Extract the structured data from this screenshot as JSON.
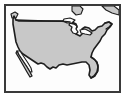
{
  "image": {
    "kind": "map-thumbnail",
    "title": "Map of the contiguous United States",
    "alt_text": "Small gray outline map of the contiguous United States on a white background inside a thin dark rectangular frame",
    "width_px": 128,
    "height_px": 103
  },
  "frame": {
    "name": "map-border",
    "border_color": "#3a3a3a",
    "border_width_px": 2,
    "inset_px": 4,
    "outer_background": "#ffffff"
  },
  "map": {
    "region_label": "Contiguous United States",
    "projection_hint": "conic",
    "background_color": "#fdfdfd",
    "land_fill_color": "#c8c8c8",
    "land_outline_color": "#1e1e1e",
    "land_outline_width_px": 1.6,
    "water_color": "#ffffff",
    "features": [
      {
        "name": "conus-landmass",
        "label": "Contiguous United States landmass",
        "fill": "#c8c8c8"
      },
      {
        "name": "canada-border-49th-parallel",
        "label": "Northern border (49th parallel)",
        "fill": "none"
      },
      {
        "name": "great-lakes",
        "label": "Great Lakes",
        "fill": "#ffffff"
      },
      {
        "name": "florida-peninsula",
        "label": "Florida peninsula",
        "fill": "#c8c8c8"
      },
      {
        "name": "baja-california-peninsula",
        "label": "Baja California peninsula",
        "fill": "#c8c8c8"
      },
      {
        "name": "gulf-of-california",
        "label": "Gulf of California",
        "fill": "#ffffff"
      },
      {
        "name": "vancouver-island",
        "label": "Vancouver Island",
        "fill": "#c8c8c8"
      },
      {
        "name": "cape-cod-new-england",
        "label": "New England coast",
        "fill": "#c8c8c8"
      }
    ],
    "labels": []
  }
}
